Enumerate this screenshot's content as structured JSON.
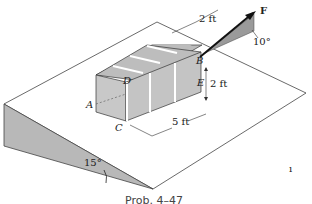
{
  "figure": {
    "caption": "Prob. 4–47",
    "labels": {
      "force": "F",
      "point_a": "A",
      "point_b": "B",
      "point_c": "C",
      "point_d": "D",
      "point_e": "E"
    },
    "dimensions": {
      "width_top": "2 ft",
      "height_side": "2 ft",
      "length_bottom": "5 ft"
    },
    "angles": {
      "force_angle": "10°",
      "incline_angle": "15°"
    },
    "stray_mark": "ı"
  },
  "colors": {
    "ramp_fill": "#b8b8b8",
    "box_fill": "#c6c6c6",
    "box_top": "#bcbcbc",
    "line": "#333333"
  }
}
